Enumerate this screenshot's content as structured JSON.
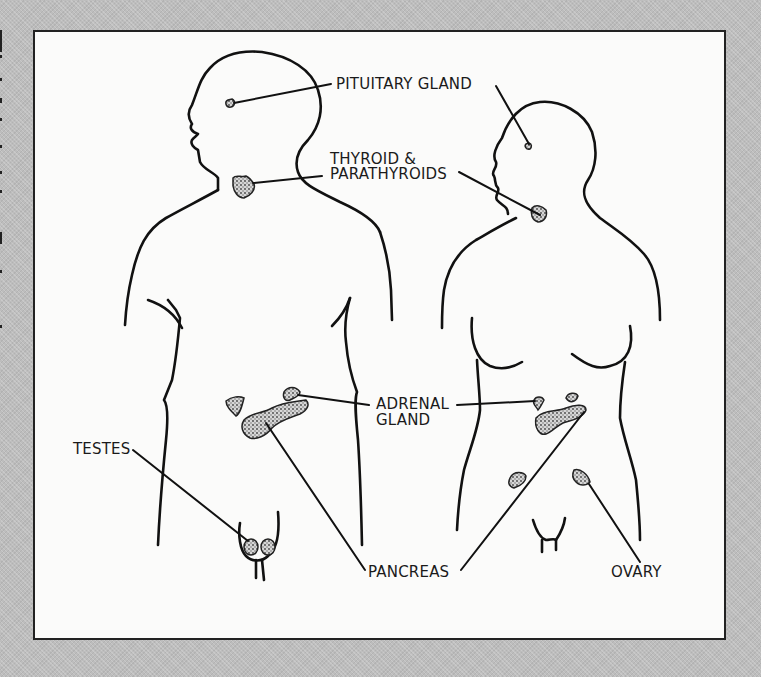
{
  "diagram": {
    "colors": {
      "background": "#bdbdbd",
      "panel": "#fbfbfa",
      "ink": "#1a1a1a",
      "gland_fill": "#9a9a9a"
    },
    "figures": [
      "male",
      "female"
    ],
    "labels": {
      "pituitary": "PITUITARY GLAND",
      "thyroid_line1": "THYROID &",
      "thyroid_line2": "PARATHYROIDS",
      "adrenal_line1": "ADRENAL",
      "adrenal_line2": "GLAND",
      "testes": "TESTES",
      "pancreas": "PANCREAS",
      "ovary": "OVARY"
    }
  }
}
